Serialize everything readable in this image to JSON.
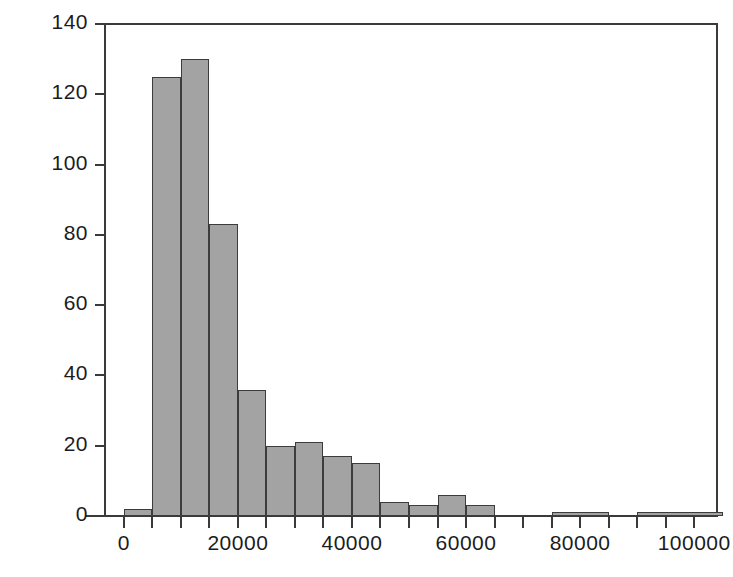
{
  "chart_data": {
    "type": "bar",
    "subtype": "histogram",
    "title": "",
    "xlabel": "",
    "ylabel": "",
    "xlim": [
      -3300,
      104000
    ],
    "ylim": [
      0,
      140
    ],
    "grid": false,
    "legend": "none",
    "bin_width": 5000,
    "bar_fill_color": "#a3a3a3",
    "bar_edge_color": "#3c3c3c",
    "axis_color": "#3a3a3a",
    "background_color": "#ffffff",
    "x_ticks_major": [
      0,
      20000,
      40000,
      60000,
      80000,
      100000
    ],
    "x_tick_labels": [
      "0",
      "20000",
      "40000",
      "60000",
      "80000",
      "100000"
    ],
    "x_ticks_minor": [
      5000,
      10000,
      15000,
      25000,
      30000,
      35000,
      45000,
      50000,
      55000,
      65000,
      70000,
      75000,
      85000,
      90000,
      95000
    ],
    "y_ticks": [
      0,
      20,
      40,
      60,
      80,
      100,
      120,
      140
    ],
    "y_tick_labels": [
      "0",
      "20",
      "40",
      "60",
      "80",
      "100",
      "120",
      "140"
    ],
    "bins": [
      {
        "x0": 0,
        "x1": 5000,
        "value": 2
      },
      {
        "x0": 5000,
        "x1": 10000,
        "value": 125
      },
      {
        "x0": 10000,
        "x1": 15000,
        "value": 130
      },
      {
        "x0": 15000,
        "x1": 20000,
        "value": 83
      },
      {
        "x0": 20000,
        "x1": 25000,
        "value": 36
      },
      {
        "x0": 25000,
        "x1": 30000,
        "value": 20
      },
      {
        "x0": 30000,
        "x1": 35000,
        "value": 21
      },
      {
        "x0": 35000,
        "x1": 40000,
        "value": 17
      },
      {
        "x0": 40000,
        "x1": 45000,
        "value": 15
      },
      {
        "x0": 45000,
        "x1": 50000,
        "value": 4
      },
      {
        "x0": 50000,
        "x1": 55000,
        "value": 3
      },
      {
        "x0": 55000,
        "x1": 60000,
        "value": 6
      },
      {
        "x0": 60000,
        "x1": 65000,
        "value": 3
      },
      {
        "x0": 65000,
        "x1": 70000,
        "value": 0
      },
      {
        "x0": 70000,
        "x1": 75000,
        "value": 0
      },
      {
        "x0": 75000,
        "x1": 85000,
        "value": 1
      },
      {
        "x0": 85000,
        "x1": 90000,
        "value": 0
      },
      {
        "x0": 90000,
        "x1": 105000,
        "value": 1
      }
    ]
  }
}
